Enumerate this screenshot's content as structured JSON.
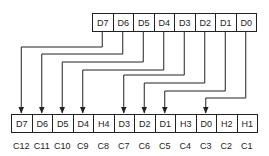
{
  "diagram": {
    "type": "bit-mapping",
    "source_register": {
      "cells": [
        "D7",
        "D6",
        "D5",
        "D4",
        "D3",
        "D2",
        "D1",
        "D0"
      ]
    },
    "target_register": {
      "cells": [
        "D7",
        "D6",
        "D5",
        "D4",
        "H4",
        "D3",
        "D2",
        "D1",
        "H3",
        "D0",
        "H2",
        "H1"
      ]
    },
    "position_labels": [
      "C12",
      "C11",
      "C10",
      "C9",
      "C8",
      "C7",
      "C6",
      "C5",
      "C4",
      "C3",
      "C2",
      "C1"
    ],
    "connections": [
      {
        "from": "D7",
        "to_index": 0,
        "route_y": 47
      },
      {
        "from": "D6",
        "to_index": 1,
        "route_y": 54
      },
      {
        "from": "D5",
        "to_index": 2,
        "route_y": 62
      },
      {
        "from": "D4",
        "to_index": 3,
        "route_y": 70
      },
      {
        "from": "D3",
        "to_index": 5,
        "route_y": 75
      },
      {
        "from": "D2",
        "to_index": 6,
        "route_y": 83
      },
      {
        "from": "D1",
        "to_index": 7,
        "route_y": 91
      },
      {
        "from": "D0",
        "to_index": 9,
        "route_y": 98
      }
    ],
    "line_color": "#222222"
  }
}
